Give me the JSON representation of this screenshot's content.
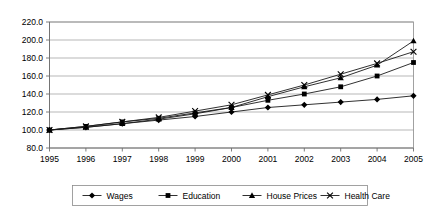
{
  "chart_data": {
    "type": "line",
    "title": "",
    "subtitle": "",
    "xlabel": "",
    "ylabel": "",
    "x": [
      1995,
      1996,
      1997,
      1998,
      1999,
      2000,
      2001,
      2002,
      2003,
      2004,
      2005
    ],
    "categories": [
      "1995",
      "1996",
      "1997",
      "1998",
      "1999",
      "2000",
      "2001",
      "2002",
      "2003",
      "2004",
      "2005"
    ],
    "xtick_labels": [
      "1995",
      "1996",
      "1997",
      "1998",
      "1999",
      "2000",
      "2001",
      "2002",
      "2003",
      "2004",
      "2005"
    ],
    "ytick_labels": [
      "80.0",
      "100.0",
      "120.0",
      "140.0",
      "160.0",
      "180.0",
      "200.0",
      "220.0"
    ],
    "yticks": [
      80,
      100,
      120,
      140,
      160,
      180,
      200,
      220
    ],
    "ylim": [
      80,
      220
    ],
    "xlim": [
      1995,
      2005
    ],
    "grid": true,
    "legend_position": "bottom",
    "series": [
      {
        "name": "Wages",
        "marker": "diamond",
        "values": [
          100,
          103,
          107,
          111,
          115,
          120,
          125,
          128,
          131,
          134,
          138
        ]
      },
      {
        "name": "Education",
        "marker": "square",
        "values": [
          100,
          104,
          109,
          113,
          119,
          125,
          133,
          140,
          148,
          160,
          175
        ]
      },
      {
        "name": "House Prices",
        "marker": "triangle",
        "values": [
          100,
          103,
          107,
          112,
          118,
          125,
          137,
          148,
          158,
          172,
          199
        ]
      },
      {
        "name": "Health Care",
        "marker": "cross",
        "values": [
          100,
          104,
          109,
          114,
          121,
          128,
          139,
          150,
          162,
          174,
          187
        ]
      }
    ],
    "legend_entries": [
      {
        "label": "Wages",
        "marker": "diamond"
      },
      {
        "label": "Education",
        "marker": "square"
      },
      {
        "label": "House Prices",
        "marker": "triangle"
      },
      {
        "label": "Health Care",
        "marker": "cross"
      }
    ]
  }
}
